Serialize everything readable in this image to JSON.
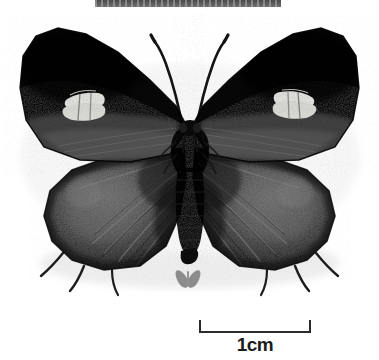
{
  "plate": {
    "width": 379,
    "height": 360,
    "background_color": "#ffffff",
    "subject": "butterfly-specimen-dorsal",
    "caption_band": {
      "visible_text": "",
      "color": "#555555",
      "note_icon": "cropped-caption-band"
    }
  },
  "specimen": {
    "name": "butterfly-specimen",
    "orientation": "dorsal-spread",
    "colors": {
      "forewing_dark": "#0a0a0a",
      "forewing_mid": "#2a2a2a",
      "hindwing_gray": "#3f3f3f",
      "hindwing_light": "#6b6b6b",
      "body_dark": "#141414",
      "patch_white": "#f2f2ee",
      "antenna": "#1a1a1a",
      "shadow": "#e2e2e2"
    },
    "features": {
      "forewing_patch": "white-band-patch",
      "antennae_count": 2,
      "hindwing_tails": 4
    }
  },
  "silhouette": {
    "name": "butterfly-silhouette-icon",
    "color": "#8c8c8c"
  },
  "scale": {
    "label": "1cm",
    "bar_color": "#2b2b2b",
    "length_px": 112
  }
}
